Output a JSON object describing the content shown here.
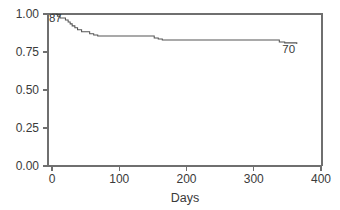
{
  "chart_data": {
    "type": "line",
    "title": "",
    "subtitle": "",
    "xlabel": "Days",
    "ylabel": "",
    "xlim": [
      -12,
      408
    ],
    "ylim": [
      0.0,
      1.0
    ],
    "grid": false,
    "legend": null,
    "x_ticks": [
      0,
      100,
      200,
      300,
      400
    ],
    "x_tick_labels": [
      "0",
      "100",
      "200",
      "300",
      "400"
    ],
    "y_ticks": [
      0.0,
      0.25,
      0.5,
      0.75,
      1.0
    ],
    "y_tick_labels": [
      "0.00",
      "0.25",
      "0.50",
      "0.75",
      "1.00"
    ],
    "series": [
      {
        "name": "survival",
        "step": "post",
        "x": [
          0,
          5,
          8,
          12,
          16,
          20,
          24,
          27,
          30,
          34,
          38,
          44,
          50,
          56,
          62,
          68,
          74,
          88,
          146,
          152,
          158,
          164,
          330,
          338,
          346,
          364
        ],
        "values": [
          1.0,
          1.0,
          0.986,
          0.974,
          0.974,
          0.961,
          0.948,
          0.935,
          0.922,
          0.909,
          0.896,
          0.883,
          0.883,
          0.87,
          0.862,
          0.855,
          0.855,
          0.855,
          0.855,
          0.842,
          0.836,
          0.829,
          0.829,
          0.816,
          0.81,
          0.803
        ]
      }
    ],
    "annotations": [
      {
        "text": "87",
        "x": 5,
        "y": 0.945,
        "role": "at-risk-start"
      },
      {
        "text": "70",
        "x": 352,
        "y": 0.745,
        "role": "at-risk-end"
      }
    ]
  },
  "axes": {
    "x_axis_title": "Days",
    "y_axis_title": ""
  },
  "colors": {
    "curve": "#555555",
    "frame": "#6f6f6f",
    "text": "#3a3a3a",
    "background": "#ffffff"
  }
}
